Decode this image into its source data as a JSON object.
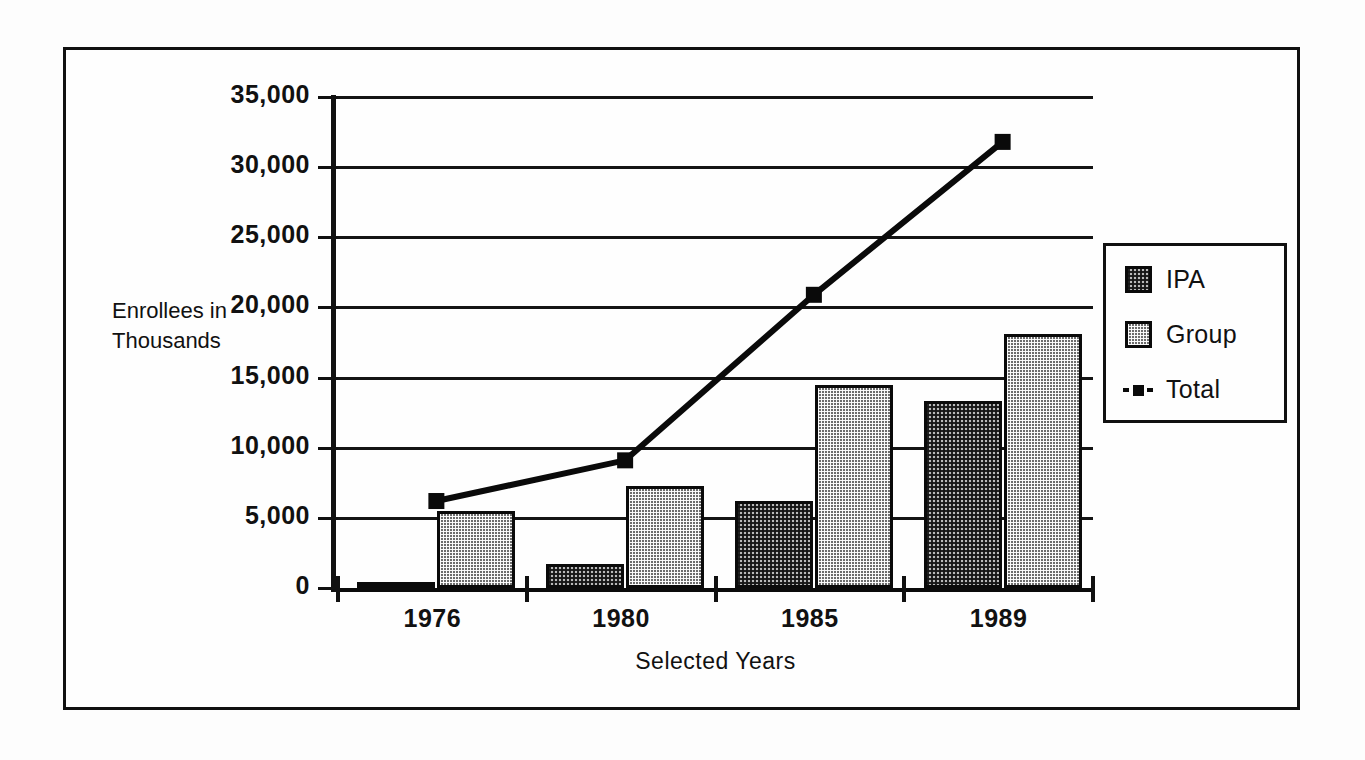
{
  "chart_data": {
    "type": "bar",
    "title": "",
    "subtitle": "",
    "xlabel": "Selected Years",
    "ylabel": "Enrollees in Thousands",
    "ylabel_lines": [
      "Enrollees in",
      "Thousands"
    ],
    "categories": [
      "1976",
      "1980",
      "1985",
      "1989"
    ],
    "ylim": [
      0,
      35000
    ],
    "ytick_values": [
      0,
      5000,
      10000,
      15000,
      20000,
      25000,
      30000,
      35000
    ],
    "ytick_labels": [
      "0",
      "5,000",
      "10,000",
      "15,000",
      "20,000",
      "25,000",
      "30,000",
      "35,000"
    ],
    "grid": true,
    "legend_position": "right",
    "series": [
      {
        "name": "IPA",
        "type": "bar",
        "values": [
          350,
          1700,
          6200,
          13300
        ]
      },
      {
        "name": "Group",
        "type": "bar",
        "values": [
          5500,
          7300,
          14500,
          18100
        ]
      },
      {
        "name": "Total",
        "type": "line",
        "values": [
          6200,
          9100,
          20900,
          31800
        ]
      }
    ],
    "colors": {
      "ipa": "#b9b9b9",
      "group": "#6d6d6d",
      "total": "#0a0a0a",
      "axis": "#111111",
      "background": "#fefefe"
    }
  },
  "axis": {
    "y_title_line1": "Enrollees in",
    "y_title_line2": "Thousands",
    "x_title": "Selected Years"
  },
  "ticks": {
    "y": [
      {
        "label": "35,000"
      },
      {
        "label": "30,000"
      },
      {
        "label": "25,000"
      },
      {
        "label": "20,000"
      },
      {
        "label": "15,000"
      },
      {
        "label": "10,000"
      },
      {
        "label": "5,000"
      },
      {
        "label": "0"
      }
    ],
    "x": [
      {
        "label": "1976"
      },
      {
        "label": "1980"
      },
      {
        "label": "1985"
      },
      {
        "label": "1989"
      }
    ]
  },
  "legend": {
    "items": [
      {
        "label": "IPA",
        "marker": "swatch-light-checker"
      },
      {
        "label": "Group",
        "marker": "swatch-dark-checker"
      },
      {
        "label": "Total",
        "marker": "dashed-line-square"
      }
    ]
  }
}
